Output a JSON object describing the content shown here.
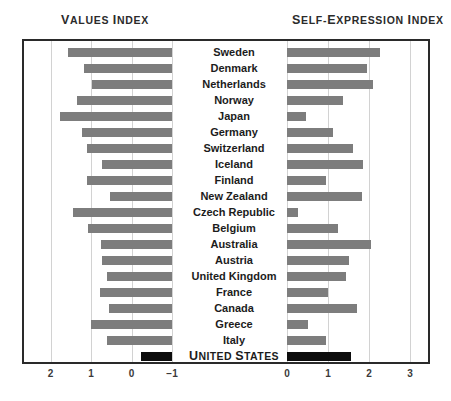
{
  "headers": {
    "left": "Values Index",
    "right": "Self-Expression Index"
  },
  "chart_data": {
    "type": "bar",
    "orientation": "horizontal",
    "panels": [
      {
        "name": "Values Index",
        "xlabel": "Values Index",
        "axis_reversed": true,
        "ticks": [
          2,
          1,
          0,
          -1
        ],
        "tick_labels": [
          "2",
          "1",
          "0",
          "-1"
        ],
        "xlim": [
          2.4,
          -1.2
        ],
        "baseline": -1.0
      },
      {
        "name": "Self-Expression Index",
        "xlabel": "Self-Expression Index",
        "axis_reversed": false,
        "ticks": [
          0,
          1,
          2,
          3
        ],
        "tick_labels": [
          "0",
          "1",
          "2",
          "3"
        ],
        "xlim": [
          -0.35,
          3.5
        ],
        "baseline": 0.0
      }
    ],
    "categories": [
      "Sweden",
      "Denmark",
      "Netherlands",
      "Norway",
      "Japan",
      "Germany",
      "Switzerland",
      "Iceland",
      "Finland",
      "New Zealand",
      "Czech Republic",
      "Belgium",
      "Australia",
      "Austria",
      "United Kingdom",
      "France",
      "Canada",
      "Greece",
      "Italy",
      "UNITED STATES"
    ],
    "series": [
      {
        "name": "Values Index",
        "panel": 0,
        "color": "#7d7d7d",
        "values": [
          1.58,
          1.17,
          0.98,
          1.35,
          1.77,
          1.22,
          1.1,
          0.73,
          1.1,
          0.52,
          1.44,
          1.08,
          0.75,
          0.73,
          0.6,
          0.78,
          0.55,
          1.0,
          0.6,
          -0.24
        ]
      },
      {
        "name": "Self-Expression Index",
        "panel": 1,
        "color": "#7d7d7d",
        "values": [
          2.27,
          1.95,
          2.1,
          1.36,
          0.46,
          1.12,
          1.6,
          1.85,
          0.95,
          1.82,
          0.28,
          1.25,
          2.05,
          1.5,
          1.44,
          1.0,
          1.7,
          0.5,
          0.95,
          1.55
        ]
      }
    ],
    "highlight": {
      "category": "UNITED STATES",
      "color": "#0d0d0d",
      "values": {
        "Values Index": -0.24,
        "Self-Expression Index": 1.55
      }
    },
    "grid": true,
    "legend": "none"
  }
}
